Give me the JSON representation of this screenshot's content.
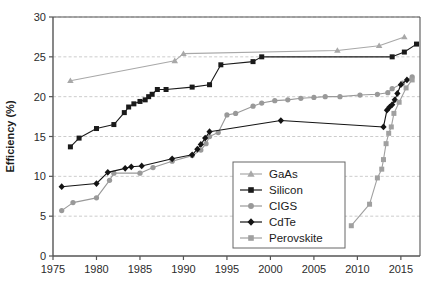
{
  "chart_data": {
    "type": "line",
    "title": "",
    "xlabel": "",
    "ylabel": "Efficiency (%)",
    "xlim": [
      1975,
      2017.2
    ],
    "ylim": [
      0,
      30
    ],
    "xticks": [
      1975,
      1980,
      1985,
      1990,
      1995,
      2000,
      2005,
      2010,
      2015
    ],
    "yticks": [
      0,
      5,
      10,
      15,
      20,
      25,
      30
    ],
    "grid": "horizontal-dashed",
    "legend_position": "lower-center-right",
    "series": [
      {
        "name": "GaAs",
        "color": "#a8a8a8",
        "marker": "triangle",
        "x": [
          1977.0,
          1989.0,
          1990.0,
          2007.7,
          2012.5,
          2015.4
        ],
        "y": [
          22.0,
          24.5,
          25.4,
          25.8,
          26.4,
          27.5
        ]
      },
      {
        "name": "Silicon",
        "color": "#1a1a1a",
        "marker": "square",
        "x": [
          1977.0,
          1978.0,
          1980.0,
          1982.0,
          1983.2,
          1983.7,
          1984.3,
          1985.0,
          1985.6,
          1986.0,
          1986.4,
          1987.0,
          1988.0,
          1991.0,
          1993.0,
          1994.3,
          1998.0,
          1999.0,
          2014.0,
          2015.4,
          2016.8
        ],
        "y": [
          13.7,
          14.8,
          16.0,
          16.5,
          18.0,
          18.7,
          19.1,
          19.4,
          19.6,
          20.0,
          20.3,
          20.9,
          20.9,
          21.2,
          21.5,
          24.0,
          24.4,
          25.0,
          25.0,
          25.6,
          26.6
        ]
      },
      {
        "name": "CIGS",
        "color": "#999999",
        "marker": "circle",
        "x": [
          1976.0,
          1977.3,
          1980.0,
          1981.5,
          1982.0,
          1985.0,
          1986.5,
          1988.7,
          1991.0,
          1992.0,
          1992.6,
          1993.0,
          1994.0,
          1995.0,
          1996.0,
          1998.0,
          1999.0,
          2000.5,
          2002.0,
          2003.5,
          2005.0,
          2006.3,
          2008.0,
          2010.3,
          2012.3,
          2013.5,
          2014.0,
          2015.2,
          2016.3
        ],
        "y": [
          5.7,
          6.7,
          7.3,
          9.5,
          10.4,
          10.4,
          11.1,
          11.9,
          12.6,
          13.3,
          14.1,
          15.0,
          15.5,
          17.7,
          17.9,
          18.8,
          19.2,
          19.5,
          19.6,
          19.8,
          19.9,
          20.0,
          20.0,
          20.2,
          20.3,
          20.5,
          21.0,
          21.7,
          22.5
        ]
      },
      {
        "name": "CdTe",
        "color": "#141414",
        "marker": "diamond",
        "x": [
          1976.0,
          1980.0,
          1981.3,
          1983.3,
          1984.0,
          1985.2,
          1988.7,
          1991.0,
          1991.6,
          1992.0,
          1992.5,
          1993.0,
          2001.2,
          2013.0,
          2013.4,
          2013.7,
          2014.0,
          2014.3,
          2014.6,
          2015.0,
          2015.7
        ],
        "y": [
          8.7,
          9.1,
          10.5,
          11.0,
          11.2,
          11.3,
          12.2,
          12.7,
          13.4,
          14.0,
          14.8,
          15.6,
          17.0,
          16.2,
          18.3,
          18.7,
          19.0,
          19.6,
          20.4,
          21.5,
          22.1
        ]
      },
      {
        "name": "Perovskite",
        "color": "#a0a0a0",
        "marker": "square",
        "x": [
          2009.3,
          2011.4,
          2012.3,
          2012.8,
          2013.0,
          2013.3,
          2013.6,
          2013.9,
          2014.2,
          2014.8,
          2015.6,
          2016.3
        ],
        "y": [
          3.8,
          6.5,
          9.8,
          10.9,
          12.1,
          14.1,
          15.4,
          16.2,
          17.9,
          19.3,
          21.1,
          22.1
        ]
      }
    ]
  },
  "axes": {
    "y_label": "Efficiency (%)",
    "y_ticks": [
      "0",
      "5",
      "10",
      "15",
      "20",
      "25",
      "30"
    ],
    "x_ticks": [
      "1975",
      "1980",
      "1985",
      "1990",
      "1995",
      "2000",
      "2005",
      "2010",
      "2015"
    ]
  },
  "legend": {
    "entries": [
      {
        "label": "GaAs",
        "marker": "triangle-icon",
        "color": "#a8a8a8"
      },
      {
        "label": "Silicon",
        "marker": "square-icon",
        "color": "#1a1a1a"
      },
      {
        "label": "CIGS",
        "marker": "circle-icon",
        "color": "#999999"
      },
      {
        "label": "CdTe",
        "marker": "diamond-icon",
        "color": "#141414"
      },
      {
        "label": "Perovskite",
        "marker": "square-icon",
        "color": "#a0a0a0"
      }
    ]
  },
  "colors": {
    "background": "#ffffff",
    "axis": "#555555",
    "grid": "#bfbfbf",
    "text": "#1a1a1a"
  }
}
